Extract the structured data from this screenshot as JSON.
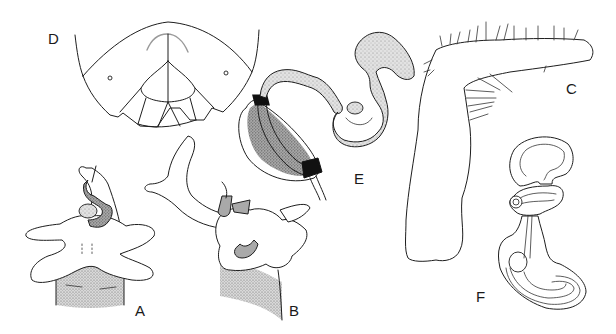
{
  "figure": {
    "colors": {
      "ink": "#1e1e1e",
      "stipple_light": "#d6d6d6",
      "stipple_dark": "#8c8c8c",
      "background": "#ffffff"
    },
    "panels": [
      {
        "id": "A",
        "label": "A",
        "content": "genital complex, ventral view, with stippled base and sclerotized coiled duct"
      },
      {
        "id": "B",
        "label": "B",
        "content": "genital complex, lateral view, with long curved process"
      },
      {
        "id": "C",
        "label": "C",
        "content": "L-shaped setose appendage"
      },
      {
        "id": "D",
        "label": "D",
        "content": "terminal abdominal segments, dorsal view, with paired spiracles"
      },
      {
        "id": "E",
        "label": "E",
        "content": "bursa/spermatheca with banded ovoid reservoir and coiled duct"
      },
      {
        "id": "F",
        "label": "F",
        "content": "spermatheca outline, double-contoured, unshaded"
      }
    ]
  }
}
